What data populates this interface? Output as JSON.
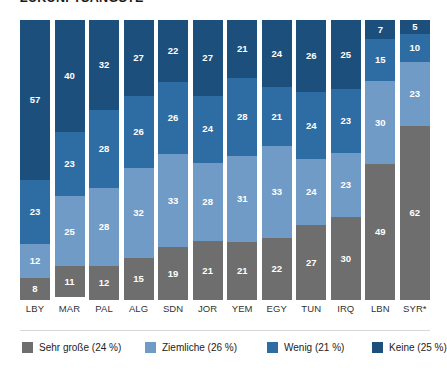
{
  "title": "ZUKUNFTSÄNGSTE",
  "chart_data": {
    "type": "bar",
    "subtype": "stacked-bar-100",
    "title": "ZUKUNFTSÄNGSTE",
    "xlabel": "",
    "ylabel": "",
    "ylim": [
      0,
      100
    ],
    "grid": false,
    "legend_position": "bottom",
    "stack_order": "bottom-to-top",
    "categories": [
      "LBY",
      "MAR",
      "PAL",
      "ALG",
      "SDN",
      "JOR",
      "YEM",
      "EGY",
      "TUN",
      "IRQ",
      "LBN",
      "SYR*"
    ],
    "series": [
      {
        "name": "Sehr große (24 %)",
        "label": "Sehr große",
        "share": "24 %",
        "color": "#6e6e6e",
        "values": [
          8,
          11,
          12,
          15,
          19,
          21,
          21,
          22,
          27,
          30,
          49,
          62
        ]
      },
      {
        "name": "Ziemliche (26 %)",
        "label": "Ziemliche",
        "share": "26 %",
        "color": "#6f9bc6",
        "values": [
          12,
          25,
          28,
          32,
          33,
          28,
          31,
          33,
          24,
          23,
          30,
          23
        ]
      },
      {
        "name": "Wenig (21 %)",
        "label": "Wenig",
        "share": "21 %",
        "color": "#2e6da4",
        "values": [
          23,
          23,
          28,
          26,
          26,
          24,
          28,
          21,
          24,
          23,
          15,
          10
        ]
      },
      {
        "name": "Keine (25 %)",
        "label": "Keine",
        "share": "25 %",
        "color": "#1d4f7c",
        "values": [
          57,
          40,
          32,
          27,
          22,
          27,
          21,
          24,
          26,
          25,
          7,
          5
        ]
      }
    ],
    "columns": [
      {
        "category": "LBY",
        "segments": [
          8,
          12,
          23,
          57
        ]
      },
      {
        "category": "MAR",
        "segments": [
          11,
          25,
          23,
          40
        ]
      },
      {
        "category": "PAL",
        "segments": [
          12,
          28,
          28,
          32
        ]
      },
      {
        "category": "ALG",
        "segments": [
          15,
          32,
          26,
          27
        ]
      },
      {
        "category": "SDN",
        "segments": [
          19,
          33,
          26,
          22
        ]
      },
      {
        "category": "JOR",
        "segments": [
          21,
          28,
          24,
          27
        ]
      },
      {
        "category": "YEM",
        "segments": [
          21,
          31,
          28,
          21
        ]
      },
      {
        "category": "EGY",
        "segments": [
          22,
          33,
          21,
          24
        ]
      },
      {
        "category": "TUN",
        "segments": [
          27,
          24,
          24,
          26
        ]
      },
      {
        "category": "IRQ",
        "segments": [
          30,
          23,
          23,
          25
        ]
      },
      {
        "category": "LBN",
        "segments": [
          49,
          30,
          15,
          7
        ]
      },
      {
        "category": "SYR*",
        "segments": [
          62,
          23,
          10,
          5
        ]
      }
    ]
  },
  "legend": [
    {
      "label": "Sehr große (24 %)",
      "color": "#6e6e6e"
    },
    {
      "label": "Ziemliche (26 %)",
      "color": "#6f9bc6"
    },
    {
      "label": "Wenig (21 %)",
      "color": "#2e6da4"
    },
    {
      "label": "Keine (25 %)",
      "color": "#1d4f7c"
    }
  ]
}
